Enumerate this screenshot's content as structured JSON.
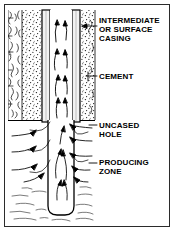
{
  "figure": {
    "kind": "well-completion-cross-section",
    "background_color": "#ffffff",
    "frame_color": "#2b2b2b",
    "ink_color": "#000000"
  },
  "labels": [
    {
      "name": "intermediate-or-surface-casing",
      "text": "INTERMEDIATE\nOR SURFACE\nCASING",
      "x": 99,
      "y": 16,
      "leader_to_x": 83,
      "leader_y": 26
    },
    {
      "name": "cement",
      "text": "CEMENT",
      "x": 99,
      "y": 72,
      "leader_to_x": 86,
      "leader_y": 76
    },
    {
      "name": "uncased-hole",
      "text": "UNCASED\nHOLE",
      "x": 99,
      "y": 121,
      "leader_to_x": 90,
      "leader_y": 125
    },
    {
      "name": "producing-zone",
      "text": "PRODUCING\nZONE",
      "x": 99,
      "y": 158,
      "leader_to_x": 90,
      "leader_y": 162
    }
  ],
  "geometry": {
    "formation_left": {
      "x": 8,
      "width": 14,
      "top": 10,
      "bottom": 120
    },
    "cement_left": {
      "x": 22,
      "width": 20,
      "top": 10,
      "bottom": 120
    },
    "casing_wall_left": {
      "x": 42,
      "width": 8,
      "top": 10,
      "bottom": 122
    },
    "fluid_column": {
      "x": 50,
      "width": 22,
      "top": 10,
      "bottom": 215
    },
    "casing_wall_right": {
      "x": 72,
      "width": 8,
      "top": 10,
      "bottom": 122
    },
    "cement_right": {
      "x": 80,
      "width": 15,
      "top": 10,
      "bottom": 120
    },
    "casing_shoe_y": 120,
    "open_hole": {
      "x": 48,
      "width": 26,
      "top": 120,
      "bottom": 215
    },
    "hole_bottom_radius": 9,
    "producing_zone": {
      "top": 120,
      "bottom": 222
    }
  },
  "flow": {
    "direction_in_casing": "up",
    "direction_in_formation": "inward",
    "arrow_color": "#000000"
  }
}
